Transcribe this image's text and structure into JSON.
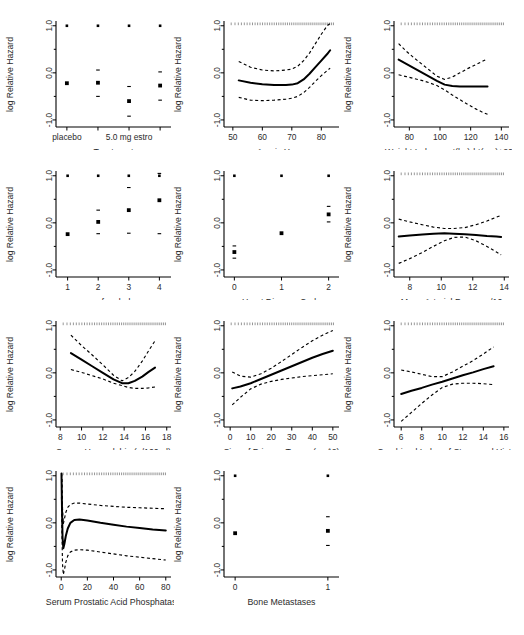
{
  "figure": {
    "ylabel": "log Relative Hazard",
    "ytick_labels": [
      "1.0",
      "0.0",
      "-1.0"
    ],
    "ytick_values": [
      1.0,
      0.0,
      -1.0
    ],
    "ylim": [
      -1.15,
      1.08
    ],
    "line_color": "#000000",
    "ci_color": "#000000",
    "rug_color": "#000000",
    "background": "#ffffff"
  },
  "chart_data": [
    {
      "type": "scatter",
      "panel_index": 0,
      "title": "Treatment",
      "xlabel": "Treatment",
      "ylabel": "log Relative Hazard",
      "style": "categorical-points",
      "categories": [
        "placebo",
        "0.2 mg estrogen",
        "1.0 mg estrogen",
        "5.0 mg estrogen"
      ],
      "xtick_labels": [
        "placebo",
        "",
        "5.0 mg estro",
        ""
      ],
      "xtick_positions": [
        0,
        1,
        2,
        3
      ],
      "xlim": [
        -0.35,
        3.35
      ],
      "ylim": [
        -1.15,
        1.08
      ],
      "estimates": [
        -0.22,
        -0.21,
        -0.6,
        -0.27
      ],
      "ci_lower": [
        -0.22,
        -0.5,
        -0.92,
        -0.58
      ],
      "ci_upper": [
        -0.22,
        0.06,
        -0.29,
        0.02
      ],
      "grid": false
    },
    {
      "type": "line",
      "panel_index": 1,
      "title": "Age in Years",
      "xlabel": "Age in Years",
      "ylabel": "log Relative Hazard",
      "style": "spline-with-ci",
      "xtick_labels": [
        "50",
        "60",
        "70",
        "80"
      ],
      "xtick_values": [
        50,
        60,
        70,
        80
      ],
      "xlim": [
        47,
        86
      ],
      "ylim": [
        -1.15,
        1.08
      ],
      "x": [
        52,
        56,
        60,
        64,
        68,
        70,
        72,
        74,
        76,
        78,
        80,
        82,
        83
      ],
      "fit": [
        -0.16,
        -0.21,
        -0.24,
        -0.26,
        -0.26,
        -0.25,
        -0.22,
        -0.14,
        -0.02,
        0.12,
        0.26,
        0.4,
        0.48
      ],
      "ci_lower": [
        -0.52,
        -0.58,
        -0.59,
        -0.58,
        -0.56,
        -0.54,
        -0.5,
        -0.42,
        -0.31,
        -0.18,
        -0.06,
        0.05,
        0.1
      ],
      "ci_upper": [
        0.24,
        0.12,
        0.06,
        0.04,
        0.06,
        0.08,
        0.14,
        0.26,
        0.42,
        0.62,
        0.82,
        1.0,
        1.05
      ],
      "rug": true,
      "grid": false
    },
    {
      "type": "line",
      "panel_index": 2,
      "title": "Weight Index = wt(kg)-ht(cm)+200",
      "xlabel": "Weight Index = wt(kg)-ht(cm)+200",
      "ylabel": "log Relative Hazard",
      "style": "spline-with-ci",
      "xtick_labels": [
        "80",
        "100",
        "120",
        "140"
      ],
      "xtick_values": [
        80,
        100,
        120,
        140
      ],
      "xlim": [
        70,
        145
      ],
      "ylim": [
        -1.15,
        1.08
      ],
      "x": [
        73,
        78,
        83,
        88,
        93,
        98,
        103,
        108,
        113,
        118,
        123,
        128,
        131
      ],
      "fit": [
        0.28,
        0.19,
        0.1,
        0.01,
        -0.08,
        -0.17,
        -0.25,
        -0.28,
        -0.29,
        -0.29,
        -0.29,
        -0.29,
        -0.29
      ],
      "ci_lower": [
        -0.04,
        -0.08,
        -0.12,
        -0.16,
        -0.21,
        -0.27,
        -0.36,
        -0.47,
        -0.57,
        -0.67,
        -0.76,
        -0.84,
        -0.88
      ],
      "ci_upper": [
        0.62,
        0.46,
        0.32,
        0.19,
        0.06,
        -0.07,
        -0.14,
        -0.09,
        0.0,
        0.09,
        0.17,
        0.25,
        0.3
      ],
      "rug": true,
      "grid": false
    },
    {
      "type": "scatter",
      "panel_index": 3,
      "title": "pf.coded",
      "xlabel": "pf.coded",
      "ylabel": "log Relative Hazard",
      "style": "categorical-points",
      "categories": [
        "1",
        "2",
        "3",
        "4"
      ],
      "xtick_labels": [
        "1",
        "2",
        "3",
        "4"
      ],
      "xtick_positions": [
        1,
        2,
        3,
        4
      ],
      "xlim": [
        0.62,
        4.38
      ],
      "ylim": [
        -1.15,
        1.08
      ],
      "estimates": [
        -0.24,
        0.02,
        0.27,
        0.48
      ],
      "ci_lower": [
        -0.24,
        -0.23,
        -0.22,
        -0.23
      ],
      "ci_upper": [
        -0.24,
        0.27,
        0.75,
        1.05
      ],
      "grid": false
    },
    {
      "type": "scatter",
      "panel_index": 4,
      "title": "Heart Disease Code",
      "xlabel": "Heart Disease Code",
      "ylabel": "log Relative Hazard",
      "style": "categorical-points",
      "categories": [
        "0",
        "1",
        "2"
      ],
      "xtick_labels": [
        "0",
        "1",
        "2"
      ],
      "xtick_positions": [
        0,
        1,
        2
      ],
      "xlim": [
        -0.22,
        2.22
      ],
      "ylim": [
        -1.15,
        1.08
      ],
      "estimates": [
        -0.62,
        -0.22,
        0.18
      ],
      "ci_lower": [
        -0.75,
        -0.22,
        0.02
      ],
      "ci_upper": [
        -0.49,
        -0.22,
        0.35
      ],
      "grid": false
    },
    {
      "type": "line",
      "panel_index": 5,
      "title": "Mean Arterial Pressure/10",
      "xlabel": "Mean Arterial Pressure/10",
      "ylabel": "log Relative Hazard",
      "style": "spline-with-ci",
      "xtick_labels": [
        "8",
        "10",
        "12",
        "14"
      ],
      "xtick_values": [
        8,
        10,
        12,
        14
      ],
      "xlim": [
        7.0,
        14.3
      ],
      "ylim": [
        -1.15,
        1.08
      ],
      "x": [
        7.3,
        8.0,
        8.8,
        9.5,
        10.2,
        10.8,
        11.5,
        12.2,
        12.9,
        13.5,
        13.8
      ],
      "fit": [
        -0.29,
        -0.27,
        -0.25,
        -0.23,
        -0.22,
        -0.23,
        -0.24,
        -0.26,
        -0.28,
        -0.29,
        -0.3
      ],
      "ci_lower": [
        -0.86,
        -0.76,
        -0.63,
        -0.5,
        -0.38,
        -0.31,
        -0.3,
        -0.38,
        -0.5,
        -0.62,
        -0.68
      ],
      "ci_upper": [
        0.08,
        0.02,
        -0.04,
        -0.09,
        -0.12,
        -0.12,
        -0.1,
        -0.04,
        0.04,
        0.12,
        0.16
      ],
      "rug": true,
      "grid": false
    },
    {
      "type": "line",
      "panel_index": 6,
      "title": "Serum Hemoglobin (g/100ml)",
      "xlabel": "Serum Hemoglobin (g/100ml)",
      "ylabel": "log Relative Hazard",
      "style": "spline-with-ci",
      "xtick_labels": [
        "8",
        "10",
        "12",
        "14",
        "16",
        "18"
      ],
      "xtick_values": [
        8,
        10,
        12,
        14,
        16,
        18
      ],
      "xlim": [
        7.6,
        18.4
      ],
      "ylim": [
        -1.15,
        1.08
      ],
      "x": [
        9.0,
        10.0,
        11.0,
        12.0,
        13.0,
        13.8,
        14.4,
        15.0,
        15.7,
        16.3,
        16.9
      ],
      "fit": [
        0.42,
        0.28,
        0.14,
        0.0,
        -0.14,
        -0.22,
        -0.22,
        -0.17,
        -0.08,
        0.02,
        0.11
      ],
      "ci_lower": [
        0.07,
        0.01,
        -0.06,
        -0.13,
        -0.22,
        -0.27,
        -0.31,
        -0.33,
        -0.33,
        -0.32,
        -0.3
      ],
      "ci_upper": [
        0.8,
        0.58,
        0.38,
        0.17,
        -0.05,
        -0.17,
        -0.1,
        0.03,
        0.25,
        0.47,
        0.68
      ],
      "rug": true,
      "grid": false
    },
    {
      "type": "line",
      "panel_index": 7,
      "title": "Size of Primary Tumor (cm^2)",
      "xlabel": "Size of Primary Tumor (cm^2)",
      "ylabel": "log Relative Hazard",
      "style": "spline-with-ci",
      "xtick_labels": [
        "0",
        "10",
        "20",
        "30",
        "40",
        "50"
      ],
      "xtick_values": [
        0,
        10,
        20,
        30,
        40,
        50
      ],
      "xlim": [
        -3,
        53
      ],
      "ylim": [
        -1.15,
        1.08
      ],
      "x": [
        1,
        5,
        10,
        15,
        20,
        25,
        30,
        35,
        40,
        45,
        50
      ],
      "fit": [
        -0.33,
        -0.29,
        -0.22,
        -0.13,
        -0.04,
        0.05,
        0.14,
        0.23,
        0.32,
        0.4,
        0.47
      ],
      "ci_lower": [
        -0.68,
        -0.52,
        -0.34,
        -0.24,
        -0.18,
        -0.14,
        -0.11,
        -0.08,
        -0.06,
        -0.04,
        -0.02
      ],
      "ci_upper": [
        0.02,
        -0.07,
        -0.09,
        -0.02,
        0.1,
        0.24,
        0.39,
        0.54,
        0.68,
        0.8,
        0.9
      ],
      "rug": true,
      "grid": false
    },
    {
      "type": "line",
      "panel_index": 8,
      "title": "Combined Index of Stage and Hist. Gr",
      "xlabel": "Combined Index of Stage and Hist. Gr",
      "ylabel": "log Relative Hazard",
      "style": "linear-with-ci",
      "xtick_labels": [
        "6",
        "8",
        "10",
        "12",
        "14",
        "16"
      ],
      "xtick_values": [
        6,
        8,
        10,
        12,
        14,
        16
      ],
      "xlim": [
        5.3,
        16.5
      ],
      "ylim": [
        -1.15,
        1.08
      ],
      "x": [
        6,
        7,
        8,
        9,
        10,
        11,
        12,
        13,
        14,
        15
      ],
      "fit": [
        -0.45,
        -0.38,
        -0.32,
        -0.25,
        -0.19,
        -0.12,
        -0.05,
        0.01,
        0.08,
        0.14
      ],
      "ci_lower": [
        -1.03,
        -0.84,
        -0.65,
        -0.47,
        -0.31,
        -0.24,
        -0.22,
        -0.22,
        -0.23,
        -0.25
      ],
      "ci_upper": [
        0.06,
        0.02,
        -0.03,
        -0.08,
        -0.08,
        0.02,
        0.14,
        0.26,
        0.4,
        0.55
      ],
      "rug": true,
      "grid": false
    },
    {
      "type": "line",
      "panel_index": 9,
      "title": "Serum Prostatic Acid Phosphatase",
      "xlabel": "Serum Prostatic Acid Phosphatase",
      "ylabel": "log Relative Hazard",
      "style": "spline-with-ci",
      "xtick_labels": [
        "0",
        "20",
        "40",
        "60",
        "80"
      ],
      "xtick_values": [
        0,
        20,
        40,
        60,
        80
      ],
      "xlim": [
        -4,
        84
      ],
      "ylim": [
        -1.15,
        1.08
      ],
      "x": [
        0.2,
        0.6,
        1.0,
        1.6,
        2.4,
        3.5,
        5,
        7,
        10,
        14,
        20,
        30,
        40,
        50,
        60,
        70,
        80
      ],
      "fit": [
        1.05,
        0.3,
        -0.3,
        -0.54,
        -0.45,
        -0.28,
        -0.12,
        0.0,
        0.06,
        0.07,
        0.05,
        0.0,
        -0.04,
        -0.08,
        -0.11,
        -0.14,
        -0.16
      ],
      "ci_lower": [
        0.55,
        -0.3,
        -0.88,
        -1.1,
        -1.0,
        -0.84,
        -0.7,
        -0.62,
        -0.58,
        -0.57,
        -0.58,
        -0.62,
        -0.66,
        -0.7,
        -0.73,
        -0.76,
        -0.79
      ],
      "ci_upper": [
        1.05,
        0.95,
        0.3,
        -0.02,
        0.08,
        0.22,
        0.33,
        0.39,
        0.42,
        0.42,
        0.4,
        0.37,
        0.35,
        0.33,
        0.32,
        0.31,
        0.3
      ],
      "rug": true,
      "grid": false
    },
    {
      "type": "scatter",
      "panel_index": 10,
      "title": "Bone Metastases",
      "xlabel": "Bone Metastases",
      "ylabel": "log Relative Hazard",
      "style": "categorical-points",
      "categories": [
        "0",
        "1"
      ],
      "xtick_labels": [
        "0",
        "1"
      ],
      "xtick_positions": [
        0,
        1
      ],
      "xlim": [
        -0.12,
        1.12
      ],
      "ylim": [
        -1.15,
        1.08
      ],
      "estimates": [
        -0.22,
        -0.17
      ],
      "ci_lower": [
        -0.22,
        -0.48
      ],
      "ci_upper": [
        -0.22,
        0.13
      ],
      "grid": false
    }
  ]
}
